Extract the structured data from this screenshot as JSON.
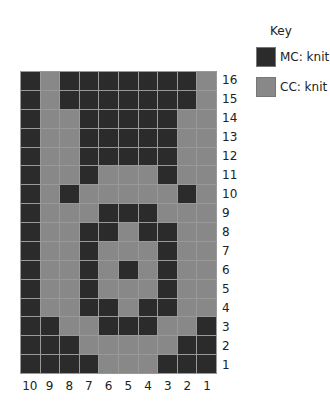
{
  "key": {
    "title": "Key",
    "items": [
      {
        "label": "MC: knit",
        "color": "#2b2b2b",
        "symbol": "mc"
      },
      {
        "label": "CC: knit",
        "color": "#888888",
        "symbol": "cc"
      }
    ]
  },
  "chart": {
    "columns": 10,
    "rows": 16,
    "column_labels": [
      "10",
      "9",
      "8",
      "7",
      "6",
      "5",
      "4",
      "3",
      "2",
      "1"
    ],
    "row_labels": [
      "16",
      "15",
      "14",
      "13",
      "12",
      "11",
      "10",
      "9",
      "8",
      "7",
      "6",
      "5",
      "4",
      "3",
      "2",
      "1"
    ],
    "grid_top_to_bottom": [
      "D.DDDDDDD.",
      "D.DDDDDDD.",
      "D..DDDDD..",
      "D..DDDDD..",
      "D..DDDDD..",
      "D..D...D..",
      "D.D.....D.",
      "D...DDD...",
      "D..DD.DD..",
      "D..D...D..",
      "D..D.D.D..",
      "D..D...D..",
      "D..DD.DD..",
      "DD..DDD..D",
      "DDD.....DD",
      "DDDD...DDD"
    ],
    "legend": {
      "D": "MC: knit",
      ".": "CC: knit"
    }
  }
}
